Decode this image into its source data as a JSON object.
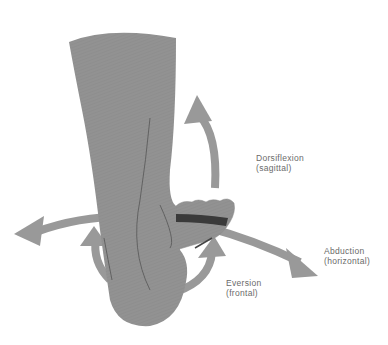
{
  "figure": {
    "colors": {
      "foot": "#909090",
      "arrow": "#999999",
      "outline": "#555555",
      "toe_band": "#3a3a3a",
      "label_text": "#6a6a6a",
      "background": "#ffffff"
    }
  },
  "labels": {
    "dorsiflexion": {
      "title": "Dorsiflexion",
      "plane": "(sagittal)"
    },
    "abduction": {
      "title": "Abduction",
      "plane": "(horizontal)"
    },
    "eversion": {
      "title": "Eversion",
      "plane": "(frontal)"
    }
  }
}
